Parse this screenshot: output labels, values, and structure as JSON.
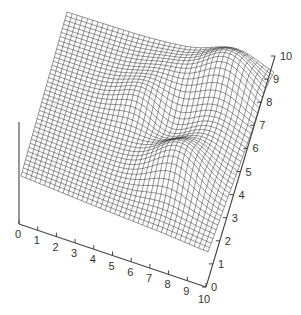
{
  "chart_data": {
    "type": "surface",
    "title": "",
    "xlabel": "",
    "ylabel": "",
    "zlabel": "",
    "x_ticks": [
      "0",
      "1",
      "2",
      "3",
      "4",
      "5",
      "6",
      "7",
      "8",
      "9",
      "10"
    ],
    "y_ticks": [
      "0",
      "1",
      "2",
      "3",
      "4",
      "5",
      "6",
      "7",
      "8",
      "9",
      "10"
    ],
    "xlim": [
      0,
      10
    ],
    "ylim": [
      0,
      10
    ],
    "grid_resolution": 41,
    "style": "wireframe mesh, black lines on white, no fill",
    "surface_description": "Flat plane with several Gaussian bumps: a tall peak near the back (x≈8, y≈8.5), a tall peak near the front (x≈7.5, y≈3), a ridge/dip near the left-center, and smaller bumps at center-right",
    "bumps": [
      {
        "x": 8.2,
        "y": 8.6,
        "amp": 34,
        "sigma": 1.2
      },
      {
        "x": 7.4,
        "y": 3.2,
        "amp": 30,
        "sigma": 1.15
      },
      {
        "x": 4.6,
        "y": 6.2,
        "amp": 14,
        "sigma": 1.0
      },
      {
        "x": 6.2,
        "y": 5.6,
        "amp": -10,
        "sigma": 0.9
      },
      {
        "x": 8.4,
        "y": 5.8,
        "amp": 10,
        "sigma": 1.1
      },
      {
        "x": 5.4,
        "y": 8.2,
        "amp": 8,
        "sigma": 1.0
      }
    ]
  },
  "colors": {
    "mesh": "#3a3a3a",
    "axis": "#444444",
    "text": "#333333",
    "background": "#ffffff"
  }
}
